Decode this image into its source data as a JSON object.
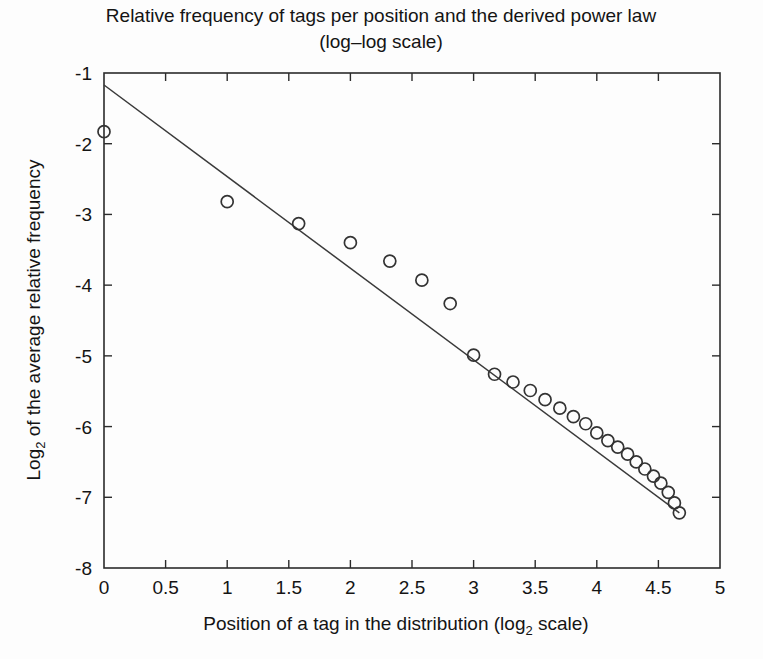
{
  "figure": {
    "background_color": "#fdfdfd",
    "foreground_color": "#1a1a1a",
    "marker_color": "#333333",
    "line_color": "#3a3a3a"
  },
  "chart_data": {
    "type": "scatter",
    "title": "Relative frequency of tags per position and the derived power law",
    "subtitle": "(log–log scale)",
    "title_line1": "Relative frequency of tags per position and the derived power law",
    "title_line2": "(log–log scale)",
    "xlabel_prefix": "Position of a tag in the distribution (log",
    "xlabel_subscript": "2",
    "xlabel_suffix": " scale)",
    "xlabel": "Position of a tag in the distribution (log2 scale)",
    "ylabel_prefix": "Log",
    "ylabel_subscript": "2",
    "ylabel_suffix": " of the average relative frequency",
    "ylabel": "Log2 of the average relative frequency",
    "xlim": [
      0,
      5
    ],
    "ylim": [
      -8,
      -1
    ],
    "xticks": [
      0,
      0.5,
      1,
      1.5,
      2,
      2.5,
      3,
      3.5,
      4,
      4.5,
      5
    ],
    "xtick_labels": [
      "0",
      "0.5",
      "1",
      "1.5",
      "2",
      "2.5",
      "3",
      "3.5",
      "4",
      "4.5",
      "5"
    ],
    "yticks": [
      -1,
      -2,
      -3,
      -4,
      -5,
      -6,
      -7,
      -8
    ],
    "ytick_labels": [
      "-1",
      "-2",
      "-3",
      "-4",
      "-5",
      "-6",
      "-7",
      "-8"
    ],
    "grid": false,
    "legend": null,
    "series": [
      {
        "name": "Average relative frequency per position",
        "type": "scatter",
        "marker": "open-circle",
        "marker_radius": 6,
        "points": [
          {
            "x": 0.0,
            "y": -1.83
          },
          {
            "x": 1.0,
            "y": -2.82
          },
          {
            "x": 1.58,
            "y": -3.13
          },
          {
            "x": 2.0,
            "y": -3.4
          },
          {
            "x": 2.32,
            "y": -3.66
          },
          {
            "x": 2.58,
            "y": -3.93
          },
          {
            "x": 2.81,
            "y": -4.26
          },
          {
            "x": 3.0,
            "y": -4.99
          },
          {
            "x": 3.17,
            "y": -5.26
          },
          {
            "x": 3.32,
            "y": -5.37
          },
          {
            "x": 3.46,
            "y": -5.49
          },
          {
            "x": 3.58,
            "y": -5.62
          },
          {
            "x": 3.7,
            "y": -5.74
          },
          {
            "x": 3.81,
            "y": -5.86
          },
          {
            "x": 3.91,
            "y": -5.96
          },
          {
            "x": 4.0,
            "y": -6.09
          },
          {
            "x": 4.09,
            "y": -6.2
          },
          {
            "x": 4.17,
            "y": -6.29
          },
          {
            "x": 4.25,
            "y": -6.39
          },
          {
            "x": 4.32,
            "y": -6.5
          },
          {
            "x": 4.39,
            "y": -6.6
          },
          {
            "x": 4.46,
            "y": -6.7
          },
          {
            "x": 4.52,
            "y": -6.8
          },
          {
            "x": 4.58,
            "y": -6.93
          },
          {
            "x": 4.63,
            "y": -7.08
          },
          {
            "x": 4.67,
            "y": -7.22
          }
        ]
      },
      {
        "name": "Derived power law fit",
        "type": "line",
        "endpoints": [
          {
            "x": 0.0,
            "y": -1.17
          },
          {
            "x": 4.67,
            "y": -7.22
          }
        ],
        "slope": -1.296,
        "intercept": -1.17
      }
    ]
  },
  "geometry": {
    "plot_left": 104,
    "plot_right": 720,
    "plot_top": 73,
    "plot_bottom": 568
  }
}
